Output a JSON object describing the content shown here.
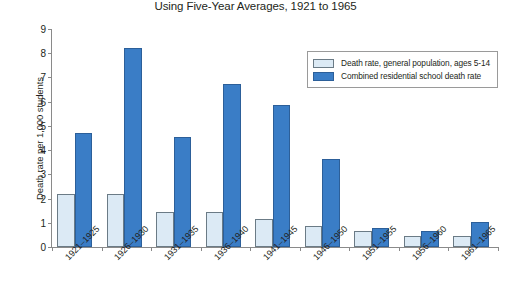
{
  "chart_data": {
    "type": "bar",
    "title": "Using Five-Year Averages, 1921 to 1965",
    "xlabel": "",
    "ylabel": "Death rate per 1,000 students",
    "ylim": [
      0,
      9
    ],
    "ytick_labels": [
      "0",
      "1",
      "2",
      "3",
      "4",
      "5",
      "6",
      "7",
      "8",
      "9"
    ],
    "yticks": [
      0,
      1,
      2,
      3,
      4,
      5,
      6,
      7,
      8,
      9
    ],
    "grid": false,
    "legend_position": "top-right",
    "categories": [
      "1921–1925",
      "1926–1930",
      "1931–1935",
      "1936–1940",
      "1941–1945",
      "1946–1950",
      "1951–1955",
      "1956–1960",
      "1961–1965"
    ],
    "series": [
      {
        "name": "Death rate, general population, ages 5-14",
        "color": "#dceaf5",
        "values": [
          2.2,
          2.2,
          1.45,
          1.45,
          1.15,
          0.85,
          0.65,
          0.45,
          0.45
        ]
      },
      {
        "name": "Combined residential school death rate",
        "color": "#3a7dc6",
        "values": [
          4.7,
          8.2,
          4.55,
          6.75,
          5.85,
          3.65,
          0.8,
          0.65,
          1.05
        ]
      }
    ]
  },
  "legend": {
    "items": [
      {
        "label": "Death rate, general population, ages 5-14",
        "swatch": "light"
      },
      {
        "label": "Combined residential school death rate",
        "swatch": "dark"
      }
    ]
  }
}
